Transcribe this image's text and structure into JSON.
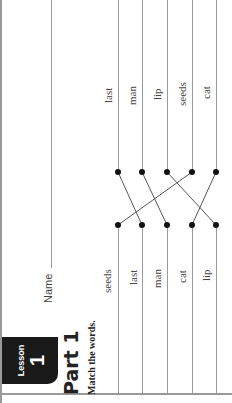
{
  "header": {
    "badge_label": "Lesson",
    "badge_number": "1",
    "part_title": "Part 1",
    "instructions": "Match the words.",
    "name_label": "Name"
  },
  "exercise": {
    "left_words": [
      "seeds",
      "last",
      "man",
      "cat",
      "lip"
    ],
    "right_words": [
      "last",
      "man",
      "lip",
      "seeds",
      "cat"
    ],
    "connections": [
      {
        "left": "seeds",
        "right": "seeds"
      },
      {
        "left": "last",
        "right": "last"
      },
      {
        "left": "man",
        "right": "man"
      },
      {
        "left": "cat",
        "right": "cat"
      },
      {
        "left": "lip",
        "right": "lip"
      }
    ]
  }
}
